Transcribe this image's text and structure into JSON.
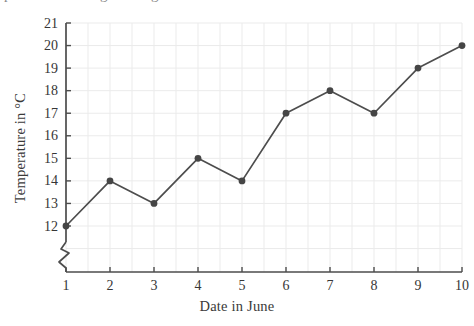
{
  "figure": {
    "cropped_top_text_fragments": [
      {
        "char": "p",
        "x": 4
      },
      {
        "char": "g",
        "x": 100
      },
      {
        "char": "g",
        "x": 151
      }
    ]
  },
  "chart_data": {
    "type": "line",
    "title": "",
    "x": [
      1,
      2,
      3,
      4,
      5,
      6,
      7,
      8,
      9,
      10
    ],
    "values": [
      12,
      14,
      13,
      15,
      14,
      17,
      18,
      17,
      19,
      20
    ],
    "xlabel": "Date in June",
    "ylabel": "Temperature in °C",
    "xlim": [
      1,
      10
    ],
    "ylim": [
      12,
      21
    ],
    "x_tick_labels": [
      "1",
      "2",
      "3",
      "4",
      "5",
      "6",
      "7",
      "8",
      "9",
      "10"
    ],
    "y_tick_labels": [
      "12",
      "13",
      "14",
      "15",
      "16",
      "17",
      "18",
      "19",
      "20",
      "21"
    ],
    "grid": true,
    "x_grid_step": 0.5,
    "y_grid_step": 1,
    "y_axis_break": true,
    "legend": null,
    "marker": "circle",
    "colors": {
      "line": "#4d4d4d",
      "marker": "#454545",
      "axis": "#4d4d4d",
      "grid": "#ebebeb",
      "tick_text": "#363636"
    }
  }
}
